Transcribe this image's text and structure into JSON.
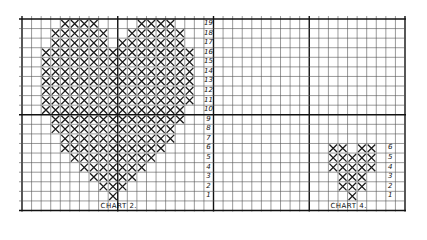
{
  "grid": {
    "origin_x": 22,
    "origin_y": 19,
    "cell": 9.575,
    "cols": 40,
    "rows": 20,
    "major_cols": [
      10,
      20,
      30
    ],
    "major_rows": [
      10
    ],
    "line_color": "#555555",
    "major_color": "#111111",
    "stitch_color": "#1a1a1a"
  },
  "charts": [
    {
      "label": "CHART 2.",
      "label_col": 8,
      "row_number_col": 19,
      "row_numbers": [
        "19",
        "18",
        "17",
        "16",
        "15",
        "14",
        "13",
        "12",
        "11",
        "10",
        "9",
        "8",
        "7",
        "6",
        "5",
        "4",
        "3",
        "2",
        "1"
      ],
      "stitches_by_row": {
        "19": [
          [
            4,
            7
          ],
          [
            12,
            15
          ]
        ],
        "18": [
          [
            3,
            8
          ],
          [
            11,
            16
          ]
        ],
        "17": [
          [
            3,
            8
          ],
          [
            10,
            16
          ]
        ],
        "16": [
          [
            2,
            9
          ],
          [
            10,
            17
          ]
        ],
        "15": [
          [
            2,
            17
          ]
        ],
        "14": [
          [
            2,
            17
          ]
        ],
        "13": [
          [
            2,
            17
          ]
        ],
        "12": [
          [
            2,
            17
          ]
        ],
        "11": [
          [
            2,
            17
          ]
        ],
        "10": [
          [
            2,
            16
          ]
        ],
        "9": [
          [
            3,
            16
          ]
        ],
        "8": [
          [
            3,
            15
          ]
        ],
        "7": [
          [
            4,
            15
          ]
        ],
        "6": [
          [
            4,
            14
          ]
        ],
        "5": [
          [
            5,
            13
          ]
        ],
        "4": [
          [
            6,
            12
          ]
        ],
        "3": [
          [
            7,
            11
          ]
        ],
        "2": [
          [
            8,
            10
          ]
        ],
        "1": [
          [
            9,
            9
          ]
        ]
      }
    },
    {
      "label": "CHART 4.",
      "label_col": 32,
      "row_number_col": 38,
      "row_numbers": [
        "6",
        "5",
        "4",
        "3",
        "2",
        "1"
      ],
      "stitches_by_row": {
        "6": [
          [
            32,
            33
          ],
          [
            35,
            36
          ]
        ],
        "5": [
          [
            32,
            36
          ]
        ],
        "4": [
          [
            32,
            36
          ]
        ],
        "3": [
          [
            33,
            35
          ]
        ],
        "2": [
          [
            33,
            35
          ]
        ],
        "1": [
          [
            34,
            34
          ]
        ]
      }
    }
  ]
}
